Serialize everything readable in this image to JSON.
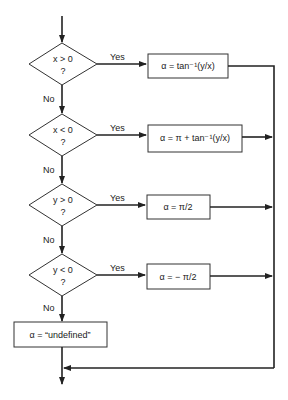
{
  "decisions": [
    {
      "condition": "x > 0",
      "question": "?",
      "yes_label": "Yes",
      "no_label": "No",
      "result": "α = tan⁻¹(y/x)"
    },
    {
      "condition": "x < 0",
      "question": "?",
      "yes_label": "Yes",
      "no_label": "No",
      "result": "α = π + tan⁻¹(y/x)"
    },
    {
      "condition": "y > 0",
      "question": "?",
      "yes_label": "Yes",
      "no_label": "No",
      "result": "α = π/2"
    },
    {
      "condition": "y < 0",
      "question": "?",
      "yes_label": "Yes",
      "no_label": "No",
      "result": "α = − π/2"
    }
  ],
  "fallback": "α = “undefined”"
}
